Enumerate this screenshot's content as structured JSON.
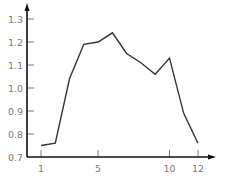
{
  "chart_data": {
    "type": "line",
    "title": "",
    "xlabel": "",
    "ylabel": "",
    "x": [
      1,
      2,
      3,
      4,
      5,
      6,
      7,
      8,
      9,
      10,
      11,
      12
    ],
    "series": [
      {
        "name": "series",
        "values": [
          0.75,
          0.76,
          1.04,
          1.19,
          1.2,
          1.24,
          1.15,
          1.11,
          1.06,
          1.13,
          0.89,
          0.76
        ]
      }
    ],
    "xticks": [
      1,
      5,
      10,
      12
    ],
    "xtick_labels": [
      "1",
      "5",
      "10",
      "12"
    ],
    "yticks": [
      0.7,
      0.8,
      0.9,
      1.0,
      1.1,
      1.2,
      1.3
    ],
    "ytick_labels": [
      "0.7",
      "0.8",
      "0.9",
      "1.0",
      "1.1",
      "1.2",
      "1.3"
    ],
    "xlim": [
      0,
      13
    ],
    "ylim": [
      0.7,
      1.35
    ],
    "grid": false,
    "legend": "none"
  },
  "colors": {
    "axis": "#111111",
    "line": "#333333",
    "tick_label": "#7a7a7a",
    "tick": "#666666"
  }
}
